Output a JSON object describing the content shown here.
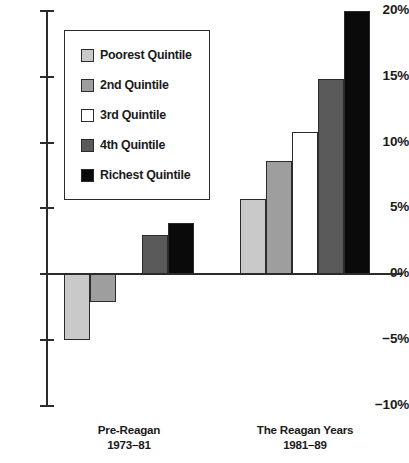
{
  "chart_data": {
    "type": "bar",
    "title": "",
    "subtitle": "",
    "xlabel": "",
    "ylabel": "",
    "ylim": [
      -10,
      20
    ],
    "ytick_labels": [
      "20%",
      "15%",
      "10%",
      "5%",
      "0%",
      "-5%",
      "-10%"
    ],
    "ytick_values": [
      20,
      15,
      10,
      5,
      0,
      -5,
      -10
    ],
    "grid": false,
    "legend_position": "upper-left-inset",
    "categories": [
      "Pre-Reagan\n1973–81",
      "The Reagan Years\n1981–89"
    ],
    "series": [
      {
        "name": "Poorest Quintile",
        "color": "#c9c9c9",
        "values": [
          -5.0,
          5.7
        ]
      },
      {
        "name": "2nd Quintile",
        "color": "#9e9e9e",
        "values": [
          -2.1,
          8.6
        ]
      },
      {
        "name": "3rd Quintile",
        "color": "#ffffff",
        "values": [
          0.0,
          10.8
        ]
      },
      {
        "name": "4th Quintile",
        "color": "#5a5a5a",
        "values": [
          2.95,
          14.8
        ]
      },
      {
        "name": "Richest Quintile",
        "color": "#0a0a0a",
        "values": [
          3.9,
          20.0
        ]
      }
    ]
  },
  "legend": {
    "items": [
      {
        "label": "Poorest Quintile",
        "color": "#c9c9c9"
      },
      {
        "label": "2nd Quintile",
        "color": "#9e9e9e"
      },
      {
        "label": "3rd Quintile",
        "color": "#ffffff"
      },
      {
        "label": "4th Quintile",
        "color": "#5a5a5a"
      },
      {
        "label": "Richest Quintile",
        "color": "#0a0a0a"
      }
    ]
  },
  "groups": [
    {
      "line1": "Pre-Reagan",
      "line2": "1973–81"
    },
    {
      "line1": "The Reagan Years",
      "line2": "1981–89"
    }
  ],
  "axis": {
    "ticks": [
      {
        "label": "20%"
      },
      {
        "label": "15%"
      },
      {
        "label": "10%"
      },
      {
        "label": "5%"
      },
      {
        "label": "0%"
      },
      {
        "label": "−5%"
      },
      {
        "label": "−10%"
      }
    ]
  },
  "colors": {
    "axis": "#2b2b2b",
    "text": "#1a1a1a",
    "background": "#ffffff"
  }
}
